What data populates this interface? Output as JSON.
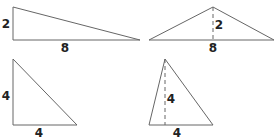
{
  "figure": {
    "stroke_color": "#666666",
    "label_color": "#222222",
    "triangles": [
      {
        "name": "right-triangle-2x8",
        "points": "13,7 13,40 140,40",
        "labels": [
          {
            "text": "2",
            "x": 6,
            "y": 28
          },
          {
            "text": "8",
            "x": 65,
            "y": 52
          }
        ]
      },
      {
        "name": "obtuse-triangle-2x8",
        "points": "149,40 213,7 274,40",
        "height_line": {
          "x1": 213,
          "y1": 7,
          "x2": 213,
          "y2": 40
        },
        "labels": [
          {
            "text": "2",
            "x": 219,
            "y": 29
          },
          {
            "text": "8",
            "x": 213,
            "y": 52
          }
        ]
      },
      {
        "name": "right-triangle-4x4",
        "points": "13,59 13,125 77,125",
        "labels": [
          {
            "text": "4",
            "x": 6,
            "y": 100
          },
          {
            "text": "4",
            "x": 39,
            "y": 137
          }
        ]
      },
      {
        "name": "acute-triangle-4x4",
        "points": "165,59 149,125 213,125",
        "height_line": {
          "x1": 165,
          "y1": 59,
          "x2": 165,
          "y2": 125
        },
        "labels": [
          {
            "text": "4",
            "x": 171,
            "y": 103
          },
          {
            "text": "4",
            "x": 177,
            "y": 137
          }
        ]
      }
    ]
  }
}
